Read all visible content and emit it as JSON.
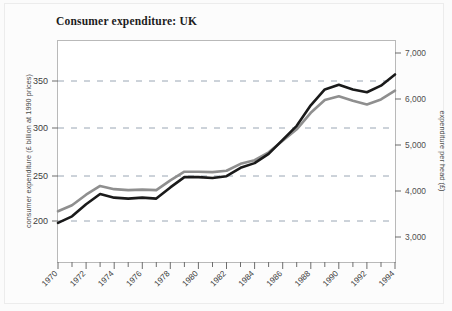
{
  "figure": {
    "title": "Consumer expenditure: UK",
    "background_color": "#fbfbfb",
    "border_color": "#ececec"
  },
  "chart_data": {
    "type": "line",
    "title": "Consumer expenditure: UK",
    "xlabel": "",
    "ylabel": "consumer expenditure (£ billion at 1990 prices)",
    "y2label": "expenditure per head (£)",
    "xlim": [
      1970,
      1994
    ],
    "ylim": [
      150,
      390
    ],
    "y2lim": [
      2650,
      7250
    ],
    "grid": true,
    "grid_style": "dashed horizontal",
    "grid_color": "#9aa6b4",
    "legend": "none",
    "x": [
      1970,
      1971,
      1972,
      1973,
      1974,
      1975,
      1976,
      1977,
      1978,
      1979,
      1980,
      1981,
      1982,
      1983,
      1984,
      1985,
      1986,
      1987,
      1988,
      1989,
      1990,
      1991,
      1992,
      1993,
      1994
    ],
    "xticks_major": [
      1970,
      1972,
      1974,
      1976,
      1978,
      1980,
      1982,
      1984,
      1986,
      1988,
      1990,
      1992,
      1994
    ],
    "xticks_minor": [
      1971,
      1973,
      1975,
      1977,
      1979,
      1981,
      1983,
      1985,
      1987,
      1989,
      1991,
      1993
    ],
    "xtick_labels": [
      "1970",
      "1972",
      "1974",
      "1976",
      "1978",
      "1980",
      "1982",
      "1984",
      "1986",
      "1988",
      "1990",
      "1992",
      "1994"
    ],
    "xtick_rotation_deg": 45,
    "yticks": [
      200,
      250,
      300,
      350
    ],
    "ytick_labels": [
      "200",
      "250",
      "300",
      "350"
    ],
    "y2ticks": [
      3000,
      4000,
      5000,
      6000,
      7000
    ],
    "y2tick_labels": [
      "3,000",
      "4,000",
      "5,000",
      "6,000",
      "7,000"
    ],
    "series": [
      {
        "name": "consumer expenditure",
        "axis": "left",
        "color": "#1a1a1a",
        "line_width": 2.6,
        "unit": "£ billion at 1990 prices",
        "values": [
          198,
          205,
          218,
          229,
          225,
          224,
          225,
          224,
          236,
          247,
          247,
          246,
          248,
          257,
          262,
          272,
          287,
          302,
          324,
          341,
          346,
          341,
          338,
          345,
          357
        ]
      },
      {
        "name": "expenditure per head",
        "axis": "right",
        "color": "#8f8f8f",
        "line_width": 2.6,
        "unit": "£",
        "values": [
          3560,
          3690,
          3920,
          4110,
          4040,
          4020,
          4030,
          4020,
          4230,
          4420,
          4420,
          4410,
          4440,
          4590,
          4670,
          4840,
          5090,
          5340,
          5700,
          5980,
          6060,
          5960,
          5880,
          5990,
          6180
        ]
      }
    ]
  },
  "axes": {
    "left_tick_labels": [
      "350",
      "300",
      "250",
      "200"
    ],
    "right_tick_labels": [
      "7,000",
      "6,000",
      "5,000",
      "4,000",
      "3,000"
    ],
    "left_axis_title": "consumer expenditure (£ billion at 1990 prices)",
    "right_axis_title": "expenditure per head (£)",
    "x_tick_labels": [
      "1970",
      "1972",
      "1974",
      "1976",
      "1978",
      "1980",
      "1982",
      "1984",
      "1986",
      "1988",
      "1990",
      "1992",
      "1994"
    ]
  }
}
